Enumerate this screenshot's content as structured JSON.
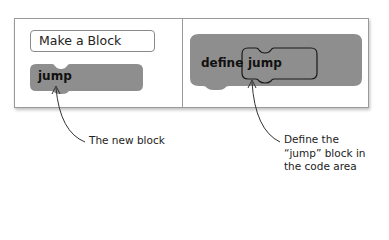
{
  "left_panel": {
    "button_label": "Make a Block",
    "new_block_label": "jump"
  },
  "right_panel": {
    "define_label": "define",
    "inner_block_label": "jump"
  },
  "captions": {
    "new_block": "The new block",
    "define_line1": "Define the",
    "define_line2": "“jump” block in",
    "define_line3": "the code area"
  },
  "colors": {
    "block_fill": "#8e8e8e",
    "frame_border": "#9a9a9a",
    "text": "#222222"
  }
}
